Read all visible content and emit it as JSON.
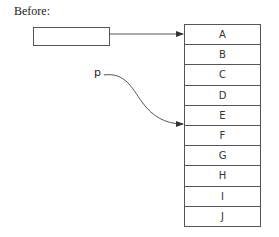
{
  "title": "Before:",
  "pointer_box": {
    "label": ""
  },
  "pointer_p": {
    "label": "p",
    "target_index": 4
  },
  "array": {
    "cells": [
      {
        "label": "A"
      },
      {
        "label": "B"
      },
      {
        "label": "C"
      },
      {
        "label": "D"
      },
      {
        "label": "E"
      },
      {
        "label": "F"
      },
      {
        "label": "G"
      },
      {
        "label": "H"
      },
      {
        "label": "I"
      },
      {
        "label": "J"
      }
    ]
  },
  "colors": {
    "stroke": "#555555",
    "text": "#222222"
  }
}
